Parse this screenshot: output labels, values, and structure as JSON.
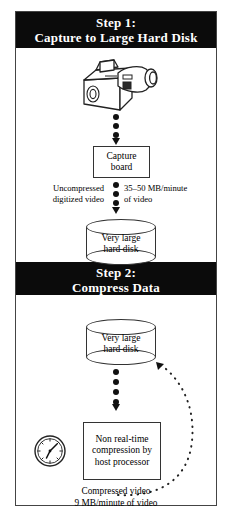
{
  "diagram": {
    "step1": {
      "header_line1": "Step 1:",
      "header_line2": "Capture to Large Hard Disk",
      "camcorder_icon": "camcorder-icon",
      "capture_box_line1": "Capture",
      "capture_box_line2": "board",
      "left_label_line1": "Uncompressed",
      "left_label_line2": "digitized video",
      "right_label_line1": "35–50 MB/minute",
      "right_label_line2": "of video",
      "disk_line1": "Very large",
      "disk_line2": "hard disk"
    },
    "step2": {
      "header_line1": "Step 2:",
      "header_line2": "Compress Data",
      "disk_line1": "Very large",
      "disk_line2": "hard disk",
      "clock_icon": "clock-icon",
      "compress_box_line1": "Non real-time",
      "compress_box_line2": "compression by",
      "compress_box_line3": "host processor",
      "output_label_line1": "Compressed video",
      "output_label_line2": "9 MB/minute of video"
    }
  },
  "colors": {
    "header_bg": "#0b0b0b",
    "header_fg": "#ffffff",
    "line": "#333333",
    "page_bg": "#ffffff"
  }
}
